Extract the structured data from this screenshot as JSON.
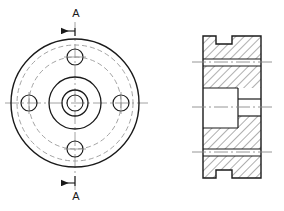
{
  "drawing": {
    "type": "engineering-orthographic-drawing",
    "title": "",
    "background_color": "#ffffff",
    "line_color": "#1a1a1a",
    "center_line_color": "#8a8a8a",
    "hidden_line_color": "#9a9a9a",
    "hatch_color": "#1a1a1a",
    "views": [
      {
        "name": "front-view",
        "description": "Circular flange front view with four bolt holes",
        "center": {
          "x": 75,
          "y": 103
        },
        "circles": [
          {
            "name": "outer-rim",
            "r": 64,
            "style": "solid"
          },
          {
            "name": "inner-rim-hidden",
            "r": 58,
            "style": "hidden"
          },
          {
            "name": "bolt-circle-hidden",
            "r": 46,
            "style": "hidden"
          },
          {
            "name": "hub-outer",
            "r": 26,
            "style": "solid"
          },
          {
            "name": "bore-outer",
            "r": 13,
            "style": "solid"
          },
          {
            "name": "bore-inner",
            "r": 8,
            "style": "solid"
          }
        ],
        "bolt_holes": {
          "count": 4,
          "radius": 8,
          "bolt_circle_radius": 46,
          "angles_deg": [
            0,
            90,
            180,
            270
          ]
        }
      },
      {
        "name": "section-view-a-a",
        "description": "Section A-A showing stepped bore, counterbore and top and bottom keyway notches",
        "bounds": {
          "left": 203,
          "right": 261,
          "top": 36,
          "bottom": 178
        },
        "hatch_angle_deg": 45,
        "features": [
          "top-notch",
          "bottom-notch",
          "stepped-bore",
          "counterbore"
        ]
      }
    ],
    "section_markers": [
      {
        "name": "section-marker-top",
        "label": "A",
        "label_x": 76,
        "label_y": 13,
        "arrow_direction": "left"
      },
      {
        "name": "section-marker-bottom",
        "label": "A",
        "label_x": 76,
        "label_y": 206,
        "arrow_direction": "left"
      }
    ],
    "center_lines": [
      {
        "name": "vertical-center-line-front",
        "x1": 75,
        "y1": 22,
        "x2": 75,
        "y2": 190
      },
      {
        "name": "horizontal-center-line-front",
        "x1": 5,
        "y1": 103,
        "x2": 148,
        "y2": 103
      },
      {
        "name": "center-line-section-upper",
        "x1": 192,
        "y1": 62,
        "x2": 272,
        "y2": 62
      },
      {
        "name": "center-line-section-middle",
        "x1": 192,
        "y1": 107,
        "x2": 272,
        "y2": 107
      },
      {
        "name": "center-line-section-lower",
        "x1": 192,
        "y1": 152,
        "x2": 272,
        "y2": 152
      }
    ]
  }
}
